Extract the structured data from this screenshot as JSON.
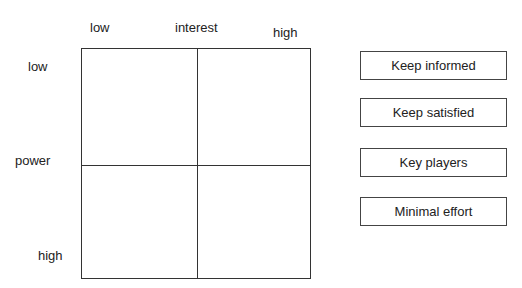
{
  "axes": {
    "x": {
      "title": "interest",
      "low": "low",
      "high": "high"
    },
    "y": {
      "title": "power",
      "low": "low",
      "high": "high"
    }
  },
  "grid": {
    "rows": 2,
    "cols": 2
  },
  "legend": [
    {
      "label": "Keep informed"
    },
    {
      "label": "Keep satisfied"
    },
    {
      "label": "Key players"
    },
    {
      "label": "Minimal effort"
    }
  ]
}
